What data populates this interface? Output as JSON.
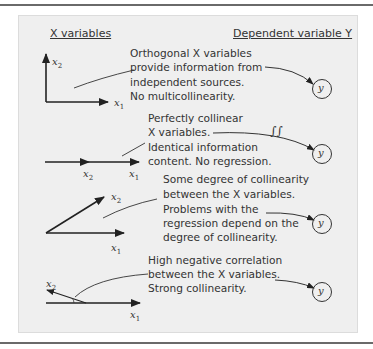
{
  "headers": {
    "left": "X variables",
    "right": "Dependent variable Y"
  },
  "rows": [
    {
      "case": "orthogonal",
      "lines": [
        "Orthogonal X variables",
        "provide information from",
        "independent sources.",
        "No multicollinearity."
      ],
      "axis_labels": {
        "x1": "x1",
        "x2": "x2"
      },
      "target": "y"
    },
    {
      "case": "perfectly-collinear",
      "lines": [
        "Perfectly collinear",
        "X variables.",
        "Identical information",
        "content.  No regression."
      ],
      "axis_labels": {
        "x1": "x1",
        "x2": "x2"
      },
      "target": "y",
      "break_mark": "∫∫"
    },
    {
      "case": "some-collinearity",
      "lines": [
        "Some degree of collinearity",
        "between the X variables.",
        "Problems with the",
        "regression depend on the",
        "degree of collinearity."
      ],
      "axis_labels": {
        "x1": "x1",
        "x2": "x2"
      },
      "target": "y"
    },
    {
      "case": "high-negative-correlation",
      "lines": [
        "High negative correlation",
        "between the X variables.",
        "Strong collinearity."
      ],
      "axis_labels": {
        "x1": "x1",
        "x2": "x2"
      },
      "target": "y"
    }
  ],
  "colors": {
    "panel_bg": "#efefef",
    "ink": "#333333",
    "rule": "#6a6a6a"
  }
}
